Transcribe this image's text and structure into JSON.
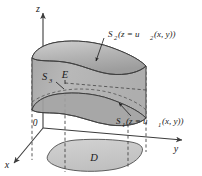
{
  "figure": {
    "axes": {
      "z_label": "z",
      "y_label": "y",
      "x_label": "x",
      "origin_label": "0"
    },
    "labels": {
      "solid": "E",
      "base_region": "D",
      "lateral_surface": "S",
      "lateral_surface_sub": "3",
      "top_surface": "S",
      "top_surface_sub": "2",
      "top_surface_eq_open": "(z = u",
      "top_surface_eq_sub": "2",
      "top_surface_eq_close": "(x, y))",
      "bottom_surface": "S",
      "bottom_surface_sub": "1",
      "bottom_surface_eq_open": "(z = u",
      "bottom_surface_eq_sub": "1",
      "bottom_surface_eq_close": "(x, y))"
    },
    "colors": {
      "background": "#ffffff",
      "solid_front_fill": "#b4b4b4",
      "solid_top_fill": "#a8a8a8",
      "solid_top_light": "#c6c6c6",
      "base_fill": "#c9c9c9",
      "stroke": "#3c3c3c",
      "dashed_stroke": "#4a4a4a",
      "text": "#1a1a1a",
      "axis_stroke": "#555555"
    }
  }
}
